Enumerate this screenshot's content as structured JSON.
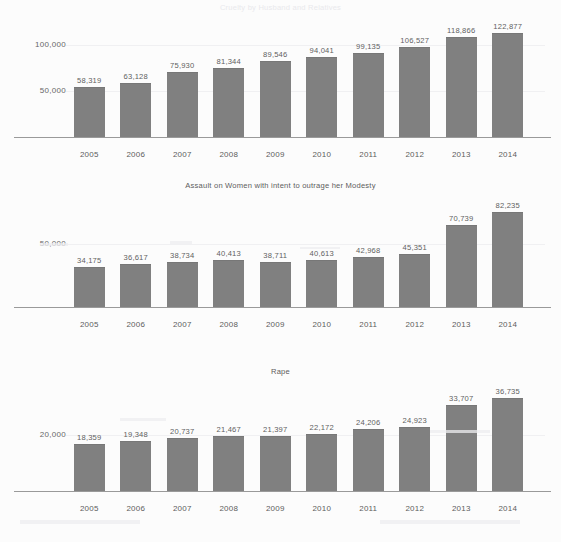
{
  "document": {
    "background_color": "#fcfcfc",
    "bar_color": "#808080",
    "text_color": "#5d5d5d"
  },
  "charts": [
    {
      "title": "Cruelty by Husband and Relatives",
      "title_visible": false,
      "ylabels": [
        "100,000",
        "50,000"
      ],
      "chart_data": {
        "type": "bar",
        "title": "Cruelty by Husband and Relatives",
        "xlabel": "",
        "ylabel": "",
        "categories": [
          "2005",
          "2006",
          "2007",
          "2008",
          "2009",
          "2010",
          "2011",
          "2012",
          "2013",
          "2014"
        ],
        "values": [
          58319,
          63128,
          75930,
          81344,
          89546,
          94041,
          99135,
          106527,
          118866,
          122877
        ],
        "value_labels": [
          "58,319",
          "63,128",
          "75,930",
          "81,344",
          "89,546",
          "94,041",
          "99,135",
          "106,527",
          "118,866",
          "122,877"
        ],
        "ytick_labels": [
          "50,000",
          "100,000"
        ],
        "ytick_values": [
          50000,
          100000
        ],
        "ylim": [
          0,
          135000
        ],
        "grid": false,
        "legend": "none"
      }
    },
    {
      "title": "Assault on Women with intent to outrage her Modesty",
      "title_visible": true,
      "ylabels": [
        "50,000"
      ],
      "chart_data": {
        "type": "bar",
        "title": "Assault on Women with intent to outrage her Modesty",
        "xlabel": "",
        "ylabel": "",
        "categories": [
          "2005",
          "2006",
          "2007",
          "2008",
          "2009",
          "2010",
          "2011",
          "2012",
          "2013",
          "2014"
        ],
        "values": [
          34175,
          36617,
          38734,
          40413,
          38711,
          40613,
          42968,
          45351,
          70739,
          82235
        ],
        "value_labels": [
          "34,175",
          "36,617",
          "38,734",
          "40,413",
          "38,711",
          "40,613",
          "42,968",
          "45,351",
          "70,739",
          "82,235"
        ],
        "ytick_labels": [
          "50,000"
        ],
        "ytick_values": [
          50000
        ],
        "ylim": [
          0,
          92000
        ],
        "grid": false,
        "legend": "none"
      }
    },
    {
      "title": "Rape",
      "title_visible": true,
      "ylabels": [
        "20,000"
      ],
      "chart_data": {
        "type": "bar",
        "title": "Rape",
        "xlabel": "",
        "ylabel": "",
        "categories": [
          "2005",
          "2006",
          "2007",
          "2008",
          "2009",
          "2010",
          "2011",
          "2012",
          "2013",
          "2014"
        ],
        "values": [
          18359,
          19348,
          20737,
          21467,
          21397,
          22172,
          24206,
          24923,
          33707,
          36735
        ],
        "value_labels": [
          "18,359",
          "19,348",
          "20,737",
          "21,467",
          "21,397",
          "22,172",
          "24,206",
          "24,923",
          "33,707",
          "36,735"
        ],
        "ytick_labels": [
          "20,000"
        ],
        "ytick_values": [
          20000
        ],
        "ylim": [
          0,
          41000
        ],
        "grid": false,
        "legend": "none"
      }
    }
  ]
}
